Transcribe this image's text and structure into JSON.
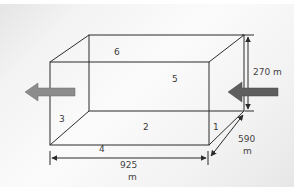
{
  "diagram": {
    "type": "rectangular-box-flow",
    "face_labels": {
      "face_1": "1",
      "face_2": "2",
      "face_3": "3",
      "face_4": "4",
      "face_5": "5",
      "face_6": "6"
    },
    "dimensions": {
      "height_value": "270 m",
      "length_value": "925",
      "length_unit": "m",
      "width_value": "590",
      "width_unit": "m"
    },
    "flow_arrows": {
      "inflow": "right-side-arrow-pointing-left",
      "outflow": "left-side-arrow-pointing-left"
    },
    "colors": {
      "line": "#2b2b2b",
      "arrow_fill": "#8c8c8c",
      "arrow_fill_dark": "#5e5e5e",
      "text": "#3a3a3a"
    }
  }
}
